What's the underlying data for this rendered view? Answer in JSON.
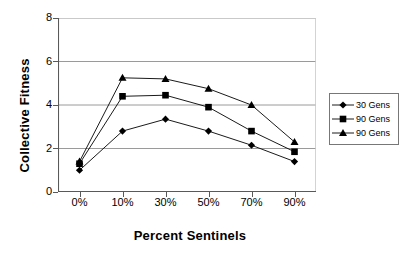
{
  "chart_data": {
    "type": "line",
    "title": "",
    "subtitle": "",
    "xlabel": "Percent Sentinels",
    "ylabel": "Collective Fitness",
    "categories": [
      "0%",
      "10%",
      "30%",
      "50%",
      "70%",
      "90%"
    ],
    "ylim": [
      0,
      8
    ],
    "yticks": [
      "0",
      "2",
      "4",
      "6",
      "8"
    ],
    "ytick_values": [
      0,
      2,
      4,
      6,
      8
    ],
    "grid": "horizontal",
    "legend_position": "right",
    "series": [
      {
        "name": "30 Gens",
        "marker": "diamond",
        "color": "#000000",
        "values": [
          1.0,
          2.8,
          3.35,
          2.8,
          2.15,
          1.4
        ]
      },
      {
        "name": "90 Gens",
        "marker": "square",
        "color": "#000000",
        "values": [
          1.3,
          4.4,
          4.45,
          3.9,
          2.8,
          1.85
        ]
      },
      {
        "name": "90 Gens",
        "marker": "triangle",
        "color": "#000000",
        "values": [
          1.4,
          5.25,
          5.2,
          4.75,
          4.0,
          2.3
        ]
      }
    ]
  },
  "colors": {
    "line": "#000000",
    "grid": "#808080",
    "axis": "#595959",
    "background": "#ffffff",
    "legend_border": "#777777"
  }
}
